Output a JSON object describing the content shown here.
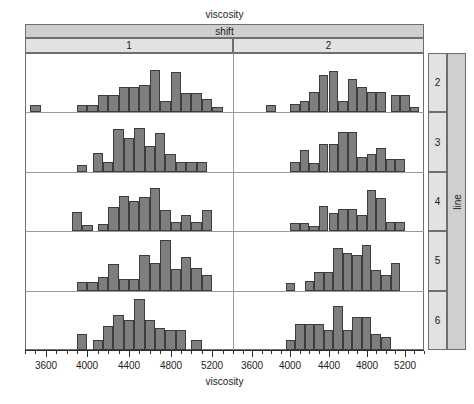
{
  "figure": {
    "top_title": "viscosity",
    "bottom_axis_title": "viscosity",
    "outer_column_label": "shift",
    "outer_row_label": "line",
    "column_levels": [
      "1",
      "2"
    ],
    "row_levels": [
      "2",
      "3",
      "4",
      "5",
      "6"
    ],
    "bar_fill": "#7e7e7e",
    "bar_stroke": "#3d3d3d",
    "strip_outer_bg": "#cfcfcf",
    "strip_inner_bg": "#e2e2e2",
    "frame_stroke": "#6e6e6e"
  },
  "axis": {
    "major_ticks": [
      3600,
      4000,
      4400,
      4800,
      5200
    ],
    "major_labels": [
      "3600",
      "4000",
      "4400",
      "4800",
      "5200"
    ],
    "minor_step": 100,
    "xmin": 3400,
    "xmax": 5400,
    "ymin": 0,
    "ymax": 1.0
  },
  "chart_data": {
    "type": "histogram",
    "title": "viscosity",
    "xlabel": "viscosity",
    "ylabel": "",
    "xlim": [
      3400,
      5400
    ],
    "grid": false,
    "legend": false,
    "facet_columns": {
      "variable": "shift",
      "levels": [
        "1",
        "2"
      ]
    },
    "facet_rows": {
      "variable": "line",
      "levels": [
        "2",
        "3",
        "4",
        "5",
        "6"
      ]
    },
    "bin_width": 100,
    "panels": [
      {
        "shift": "1",
        "line": "2",
        "bin_starts": [
          3450,
          3900,
          4000,
          4100,
          4200,
          4300,
          4400,
          4500,
          4600,
          4700,
          4800,
          4900,
          5000,
          5100,
          5200
        ],
        "counts": [
          0.14,
          0.14,
          0.14,
          0.33,
          0.33,
          0.48,
          0.48,
          0.52,
          0.8,
          0.22,
          0.75,
          0.36,
          0.36,
          0.25,
          0.1
        ]
      },
      {
        "shift": "2",
        "line": "2",
        "bin_starts": [
          3750,
          4000,
          4100,
          4200,
          4300,
          4400,
          4500,
          4600,
          4700,
          4800,
          4900,
          5050,
          5150,
          5250
        ],
        "counts": [
          0.14,
          0.16,
          0.22,
          0.38,
          0.7,
          0.78,
          0.22,
          0.62,
          0.47,
          0.38,
          0.38,
          0.33,
          0.33,
          0.1
        ]
      },
      {
        "shift": "1",
        "line": "3",
        "bin_starts": [
          3900,
          4050,
          4150,
          4250,
          4350,
          4450,
          4550,
          4650,
          4750,
          4850,
          4950,
          5050
        ],
        "counts": [
          0.12,
          0.36,
          0.18,
          0.8,
          0.64,
          0.82,
          0.48,
          0.72,
          0.33,
          0.18,
          0.18,
          0.18
        ]
      },
      {
        "shift": "2",
        "line": "3",
        "bin_starts": [
          4000,
          4100,
          4200,
          4300,
          4400,
          4500,
          4600,
          4700,
          4800,
          4900,
          5000,
          5100
        ],
        "counts": [
          0.18,
          0.4,
          0.16,
          0.52,
          0.52,
          0.74,
          0.74,
          0.28,
          0.33,
          0.44,
          0.24,
          0.24
        ]
      },
      {
        "shift": "1",
        "line": "4",
        "bin_starts": [
          3850,
          3950,
          4100,
          4200,
          4300,
          4400,
          4500,
          4600,
          4700,
          4800,
          4900,
          5000,
          5100
        ],
        "counts": [
          0.36,
          0.12,
          0.14,
          0.45,
          0.66,
          0.56,
          0.64,
          0.8,
          0.4,
          0.18,
          0.3,
          0.18,
          0.4
        ]
      },
      {
        "shift": "2",
        "line": "4",
        "bin_starts": [
          4000,
          4100,
          4200,
          4300,
          4400,
          4500,
          4600,
          4700,
          4800,
          4900,
          5000,
          5100
        ],
        "counts": [
          0.16,
          0.16,
          0.1,
          0.48,
          0.34,
          0.42,
          0.42,
          0.3,
          0.78,
          0.62,
          0.18,
          0.18
        ]
      },
      {
        "shift": "1",
        "line": "5",
        "bin_starts": [
          3900,
          4000,
          4100,
          4200,
          4300,
          4400,
          4500,
          4600,
          4700,
          4800,
          4900,
          5000,
          5100
        ],
        "counts": [
          0.16,
          0.16,
          0.26,
          0.5,
          0.22,
          0.22,
          0.66,
          0.52,
          0.95,
          0.4,
          0.62,
          0.42,
          0.3
        ]
      },
      {
        "shift": "2",
        "line": "5",
        "bin_starts": [
          3950,
          4150,
          4250,
          4350,
          4450,
          4550,
          4650,
          4750,
          4850,
          4950,
          5050
        ],
        "counts": [
          0.14,
          0.18,
          0.34,
          0.34,
          0.8,
          0.7,
          0.66,
          0.85,
          0.38,
          0.3,
          0.52
        ]
      },
      {
        "shift": "1",
        "line": "6",
        "bin_starts": [
          3900,
          4050,
          4150,
          4250,
          4350,
          4450,
          4550,
          4650,
          4750,
          4850,
          5000
        ],
        "counts": [
          0.3,
          0.18,
          0.45,
          0.66,
          0.56,
          0.95,
          0.56,
          0.42,
          0.38,
          0.38,
          0.18,
          0.18
        ]
      },
      {
        "shift": "2",
        "line": "6",
        "bin_starts": [
          3950,
          4050,
          4150,
          4250,
          4350,
          4450,
          4550,
          4650,
          4750,
          4850,
          4950
        ],
        "counts": [
          0.18,
          0.48,
          0.48,
          0.48,
          0.38,
          0.82,
          0.38,
          0.62,
          0.62,
          0.3,
          0.24,
          0.24
        ]
      }
    ]
  }
}
